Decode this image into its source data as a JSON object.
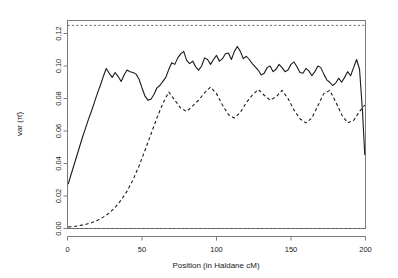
{
  "chart_data": {
    "type": "line",
    "title": "",
    "xlabel": "Position (in Haldane cM)",
    "ylabel": "var (π̂)",
    "xlim": [
      0,
      200
    ],
    "ylim": [
      0.0,
      0.128
    ],
    "grid": false,
    "legend": null,
    "xticks": [
      0,
      50,
      100,
      150,
      200
    ],
    "xticklabels": [
      "0",
      "50",
      "100",
      "150",
      "200"
    ],
    "yticks": [
      0.0,
      0.02,
      0.04,
      0.06,
      0.08,
      0.1,
      0.12
    ],
    "yticklabels": [
      "0.00",
      "0.02",
      "0.04",
      "0.06",
      "0.08",
      "0.10",
      "0.12"
    ],
    "reference_lines": [
      {
        "name": "upper-bound",
        "y": 0.125,
        "style": "dashed"
      },
      {
        "name": "lower-bound",
        "y": 0.0,
        "style": "dashed"
      }
    ],
    "series": [
      {
        "name": "solid-curve",
        "style": "solid",
        "color": "#1a1a1a",
        "x": [
          0.5,
          2,
          4,
          6,
          8,
          10,
          12,
          14,
          16,
          18,
          20,
          22,
          24,
          26,
          28,
          30,
          32,
          34,
          36,
          38,
          40,
          42,
          44,
          46,
          48,
          50,
          52,
          54,
          56,
          58,
          60,
          62,
          64,
          66,
          68,
          70,
          72,
          74,
          76,
          78,
          80,
          82,
          84,
          86,
          88,
          90,
          92,
          94,
          96,
          98,
          100,
          102,
          104,
          106,
          108,
          110,
          112,
          114,
          116,
          118,
          120,
          122,
          124,
          126,
          128,
          130,
          132,
          134,
          136,
          138,
          140,
          142,
          144,
          146,
          148,
          150,
          152,
          154,
          156,
          158,
          160,
          162,
          164,
          166,
          168,
          170,
          172,
          174,
          176,
          178,
          180,
          182,
          184,
          186,
          188,
          190,
          192,
          194,
          196,
          198,
          199.5
        ],
        "y": [
          0.0275,
          0.032,
          0.038,
          0.044,
          0.05,
          0.056,
          0.0615,
          0.067,
          0.072,
          0.0775,
          0.083,
          0.088,
          0.0935,
          0.0985,
          0.0955,
          0.093,
          0.096,
          0.0935,
          0.0905,
          0.0945,
          0.0975,
          0.0965,
          0.096,
          0.095,
          0.092,
          0.0865,
          0.0815,
          0.079,
          0.0795,
          0.0825,
          0.0865,
          0.088,
          0.0905,
          0.093,
          0.098,
          0.102,
          0.101,
          0.105,
          0.1075,
          0.109,
          0.1035,
          0.1015,
          0.103,
          0.0995,
          0.0975,
          0.1,
          0.105,
          0.104,
          0.101,
          0.104,
          0.1065,
          0.103,
          0.1045,
          0.1075,
          0.108,
          0.104,
          0.109,
          0.112,
          0.109,
          0.1045,
          0.106,
          0.104,
          0.1015,
          0.0995,
          0.0975,
          0.0945,
          0.0955,
          0.099,
          0.1,
          0.0965,
          0.098,
          0.101,
          0.099,
          0.0965,
          0.0975,
          0.101,
          0.1025,
          0.0995,
          0.096,
          0.0955,
          0.0985,
          0.097,
          0.094,
          0.0965,
          0.1,
          0.099,
          0.095,
          0.0915,
          0.09,
          0.088,
          0.0895,
          0.0925,
          0.09,
          0.093,
          0.0965,
          0.094,
          0.099,
          0.104,
          0.098,
          0.072,
          0.0455
        ]
      },
      {
        "name": "dashed-curve",
        "style": "dashed",
        "color": "#1a1a1a",
        "x": [
          0.5,
          4,
          8,
          12,
          16,
          20,
          24,
          28,
          32,
          36,
          40,
          44,
          48,
          52,
          56,
          60,
          64,
          68,
          72,
          76,
          80,
          84,
          88,
          92,
          96,
          100,
          104,
          108,
          112,
          116,
          120,
          124,
          128,
          132,
          136,
          140,
          144,
          148,
          152,
          156,
          160,
          164,
          168,
          172,
          176,
          180,
          184,
          188,
          192,
          196,
          199.5
        ],
        "y": [
          0.001,
          0.0012,
          0.0018,
          0.0025,
          0.0035,
          0.005,
          0.007,
          0.0095,
          0.013,
          0.0175,
          0.023,
          0.03,
          0.0385,
          0.048,
          0.058,
          0.068,
          0.077,
          0.084,
          0.079,
          0.074,
          0.072,
          0.0755,
          0.079,
          0.0835,
          0.087,
          0.083,
          0.076,
          0.07,
          0.068,
          0.0715,
          0.0775,
          0.082,
          0.0855,
          0.082,
          0.079,
          0.081,
          0.085,
          0.08,
          0.073,
          0.0675,
          0.065,
          0.068,
          0.0755,
          0.083,
          0.085,
          0.078,
          0.07,
          0.065,
          0.0665,
          0.072,
          0.076
        ]
      }
    ],
    "series_tail": {
      "solid_end_value": 0.0455,
      "dashed_end_value": 0.022
    }
  },
  "axes": {
    "x_title": "Position (in Haldane cM)",
    "y_title": "var (π̂)"
  }
}
